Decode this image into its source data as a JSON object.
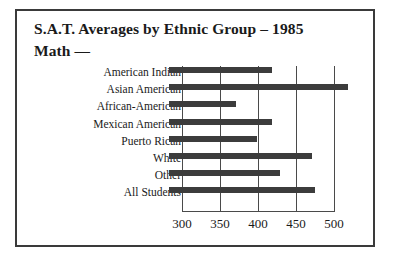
{
  "figure": {
    "title_line_1": "S.A.T. Averages by Ethnic Group –  1985",
    "title_line_2": "Math —"
  },
  "chart_data": {
    "type": "bar",
    "orientation": "horizontal",
    "title": "S.A.T. Averages by Ethnic Group – 1985",
    "subtitle": "Math —",
    "xlabel": "",
    "ylabel": "",
    "xlim": [
      300,
      500
    ],
    "grid": true,
    "legend": "none",
    "xticks": [
      300,
      350,
      400,
      450,
      500
    ],
    "xtick_labels": [
      "300",
      "350",
      "400",
      "450",
      "500"
    ],
    "categories": [
      "American Indian",
      "Asian American",
      "African-American",
      "Mexican American",
      "Puerto Rican",
      "White",
      "Other",
      "All Students"
    ],
    "values": [
      418,
      518,
      371,
      418,
      399,
      471,
      429,
      475
    ],
    "series": [
      {
        "name": "Math",
        "values": [
          418,
          518,
          371,
          418,
          399,
          471,
          429,
          475
        ]
      }
    ]
  }
}
